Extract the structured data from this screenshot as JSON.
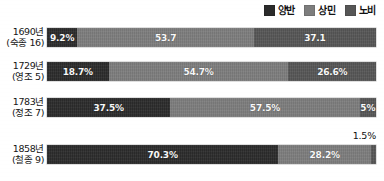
{
  "legend": {
    "items": [
      {
        "label": "양반",
        "color": "#2b2b2b",
        "icon": "legend-swatch-icon"
      },
      {
        "label": "상민",
        "color": "#7d7d7d",
        "icon": "legend-swatch-icon"
      },
      {
        "label": "노비",
        "color": "#565656",
        "icon": "legend-swatch-icon"
      }
    ]
  },
  "rows": [
    {
      "year": "1690년",
      "reign": "(숙종 16)",
      "values": [
        {
          "label": "9.2%",
          "value": 9.2
        },
        {
          "label": "53.7",
          "value": 53.7
        },
        {
          "label": "37.1",
          "value": 37.1
        }
      ]
    },
    {
      "year": "1729년",
      "reign": "(영조 5)",
      "values": [
        {
          "label": "18.7%",
          "value": 18.7
        },
        {
          "label": "54.7%",
          "value": 54.7
        },
        {
          "label": "26.6%",
          "value": 26.6
        }
      ]
    },
    {
      "year": "1783년",
      "reign": "(정조 7)",
      "values": [
        {
          "label": "37.5%",
          "value": 37.5
        },
        {
          "label": "57.5%",
          "value": 57.5
        },
        {
          "label": "5%",
          "value": 5.0
        }
      ]
    },
    {
      "year": "1858년",
      "reign": "(철종 9)",
      "values": [
        {
          "label": "70.3%",
          "value": 70.3
        },
        {
          "label": "28.2%",
          "value": 28.2
        },
        {
          "label": "1.5%",
          "value": 1.5,
          "outside": true
        }
      ]
    }
  ],
  "chart_data": {
    "type": "bar",
    "orientation": "horizontal",
    "stacked": true,
    "normalized_percent": true,
    "title": "",
    "subtitle": "",
    "xlabel": "",
    "ylabel": "",
    "xlim": [
      0,
      100
    ],
    "grid": false,
    "legend_position": "top-right",
    "categories": [
      "1690년 (숙종 16)",
      "1729년 (영조 5)",
      "1783년 (정조 7)",
      "1858년 (철종 9)"
    ],
    "series": [
      {
        "name": "양반",
        "color": "#2b2b2b",
        "values": [
          9.2,
          18.7,
          37.5,
          70.3
        ]
      },
      {
        "name": "상민",
        "color": "#7d7d7d",
        "values": [
          53.7,
          54.7,
          57.5,
          28.2
        ]
      },
      {
        "name": "노비",
        "color": "#565656",
        "values": [
          37.1,
          26.6,
          5.0,
          1.5
        ]
      }
    ],
    "data_labels": [
      [
        "9.2%",
        "53.7",
        "37.1"
      ],
      [
        "18.7%",
        "54.7%",
        "26.6%"
      ],
      [
        "37.5%",
        "57.5%",
        "5%"
      ],
      [
        "70.3%",
        "28.2%",
        "1.5%"
      ]
    ],
    "annotations": [
      {
        "text": "1.5%",
        "series": "노비",
        "category": "1858년 (철종 9)",
        "placement": "outside-above-right"
      }
    ]
  }
}
